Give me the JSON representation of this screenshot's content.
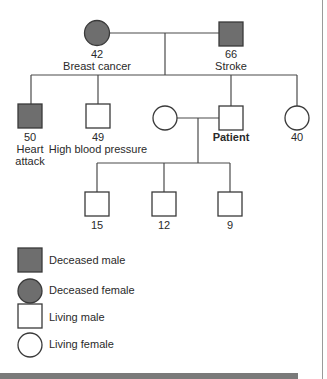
{
  "diagram": {
    "type": "pedigree",
    "colors": {
      "deceased_fill": "#6e6e6e",
      "line": "#4a4a4a",
      "living_fill": "#ffffff"
    },
    "grandparents": [
      {
        "id": "grandmother",
        "sex": "female",
        "status": "deceased",
        "age": "42",
        "condition": "Breast cancer"
      },
      {
        "id": "grandfather",
        "sex": "male",
        "status": "deceased",
        "age": "66",
        "condition": "Stroke"
      }
    ],
    "siblings": [
      {
        "id": "uncle1",
        "sex": "male",
        "status": "deceased",
        "age": "50",
        "condition_line1": "Heart",
        "condition_line2": "attack"
      },
      {
        "id": "uncle2",
        "sex": "male",
        "status": "living",
        "age": "49",
        "condition": "High blood pressure"
      },
      {
        "id": "spouse",
        "sex": "female",
        "status": "living"
      },
      {
        "id": "patient",
        "sex": "male",
        "status": "living",
        "label": "Patient"
      },
      {
        "id": "aunt",
        "sex": "female",
        "status": "living",
        "age": "40"
      }
    ],
    "children": [
      {
        "sex": "male",
        "status": "living",
        "age": "15"
      },
      {
        "sex": "male",
        "status": "living",
        "age": "12"
      },
      {
        "sex": "male",
        "status": "living",
        "age": "9"
      }
    ]
  },
  "legend": [
    {
      "symbol": "square-filled",
      "label": "Deceased male"
    },
    {
      "symbol": "circle-filled",
      "label": "Deceased female"
    },
    {
      "symbol": "square-open",
      "label": "Living male"
    },
    {
      "symbol": "circle-open",
      "label": "Living female"
    }
  ]
}
